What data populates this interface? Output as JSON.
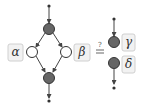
{
  "diagram": {
    "left": {
      "labels": {
        "alpha": "α",
        "beta": "β"
      }
    },
    "relation": {
      "question": "?",
      "symbol": "="
    },
    "right": {
      "labels": {
        "gamma": "γ",
        "delta": "δ"
      }
    },
    "colors": {
      "filled_node": "#666666",
      "node_stroke": "#333333",
      "edge": "#444444",
      "label_box_fill": "#f2f2f2",
      "label_box_stroke": "#d0d0d0"
    }
  }
}
